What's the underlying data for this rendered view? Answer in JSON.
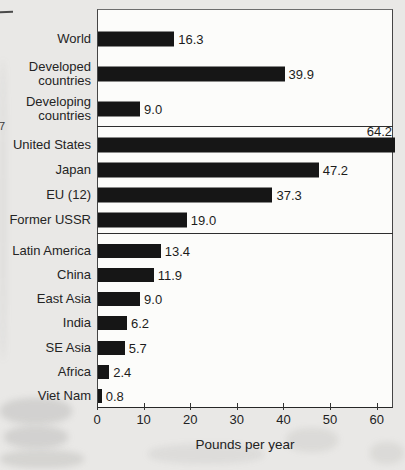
{
  "marginalia": {
    "digit": "7"
  },
  "chart_data": {
    "type": "bar",
    "orientation": "horizontal",
    "title": "",
    "xlabel": "Pounds per year",
    "ylabel": "",
    "xlim": [
      0,
      63.5
    ],
    "xticks": [
      0,
      10,
      20,
      30,
      40,
      50,
      60
    ],
    "grid": false,
    "legend": false,
    "bar_color": "#161616",
    "groups": [
      {
        "name": "world-aggregates",
        "items": [
          {
            "label": "World",
            "value": 16.3
          },
          {
            "label": "Developed countries",
            "value": 39.9
          },
          {
            "label": "Developing countries",
            "value": 9.0
          }
        ]
      },
      {
        "name": "developed-regions",
        "items": [
          {
            "label": "United States",
            "value": 64.2,
            "value_label_position": "above"
          },
          {
            "label": "Japan",
            "value": 47.2
          },
          {
            "label": "EU (12)",
            "value": 37.3
          },
          {
            "label": "Former USSR",
            "value": 19.0
          }
        ]
      },
      {
        "name": "developing-regions",
        "items": [
          {
            "label": "Latin America",
            "value": 13.4
          },
          {
            "label": "China",
            "value": 11.9
          },
          {
            "label": "East Asia",
            "value": 9.0
          },
          {
            "label": "India",
            "value": 6.2
          },
          {
            "label": "SE Asia",
            "value": 5.7
          },
          {
            "label": "Africa",
            "value": 2.4
          },
          {
            "label": "Viet Nam",
            "value": 0.8
          }
        ]
      }
    ]
  }
}
